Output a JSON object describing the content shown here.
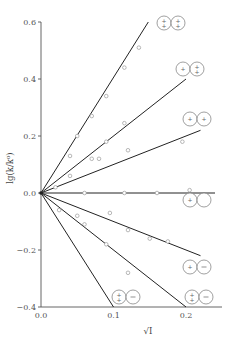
{
  "chart_data": {
    "type": "line",
    "title": "",
    "xlabel": "√I",
    "ylabel": "lg(k/k⁰)",
    "xlim": [
      0.0,
      0.25
    ],
    "ylim": [
      -0.4,
      0.6
    ],
    "x_ticks": [
      "0.0",
      "0.1",
      "0.2"
    ],
    "y_ticks": [
      "0.6",
      "0.4",
      "0.2",
      "0.0",
      "−0.2",
      "−0.4"
    ],
    "grid": false,
    "legend_position": "inline glyph labels at line ends",
    "series": [
      {
        "name": "(++)(++)",
        "zAzB": 4,
        "ion_a": "++",
        "ion_b": "++",
        "line": [
          [
            0.0,
            0.0
          ],
          [
            0.148,
            0.6
          ]
        ],
        "points": [
          [
            0.05,
            0.2
          ],
          [
            0.07,
            0.27
          ],
          [
            0.09,
            0.34
          ],
          [
            0.115,
            0.44
          ],
          [
            0.135,
            0.51
          ]
        ]
      },
      {
        "name": "(+)(++)",
        "zAzB": 2,
        "ion_a": "+",
        "ion_b": "++",
        "line": [
          [
            0.0,
            0.0
          ],
          [
            0.2,
            0.4
          ]
        ],
        "points": [
          [
            0.04,
            0.13
          ],
          [
            0.07,
            0.12
          ],
          [
            0.09,
            0.18
          ],
          [
            0.115,
            0.245
          ]
        ]
      },
      {
        "name": "(+)(+)",
        "zAzB": 1,
        "ion_a": "+",
        "ion_b": "+",
        "line": [
          [
            0.0,
            0.0
          ],
          [
            0.22,
            0.22
          ]
        ],
        "points": [
          [
            0.02,
            0.02
          ],
          [
            0.04,
            0.06
          ],
          [
            0.08,
            0.12
          ],
          [
            0.12,
            0.15
          ],
          [
            0.195,
            0.18
          ]
        ]
      },
      {
        "name": "(+)(○)",
        "zAzB": 0,
        "ion_a": "+",
        "ion_b": "0",
        "line": [
          [
            0.0,
            0.0
          ],
          [
            0.24,
            0.0
          ]
        ],
        "points": [
          [
            0.06,
            0.0
          ],
          [
            0.115,
            0.0
          ],
          [
            0.16,
            0.0
          ],
          [
            0.205,
            0.01
          ]
        ]
      },
      {
        "name": "(+)(−)",
        "zAzB": -1,
        "ion_a": "+",
        "ion_b": "−",
        "line": [
          [
            0.0,
            0.0
          ],
          [
            0.22,
            -0.22
          ]
        ],
        "points": [
          [
            0.095,
            -0.07
          ],
          [
            0.12,
            -0.13
          ],
          [
            0.15,
            -0.16
          ],
          [
            0.175,
            -0.17
          ]
        ]
      },
      {
        "name": "(++)(−)",
        "zAzB": -2,
        "ion_a": "++",
        "ion_b": "−",
        "line": [
          [
            0.0,
            0.0
          ],
          [
            0.2,
            -0.4
          ]
        ],
        "points": [
          [
            0.025,
            -0.06
          ],
          [
            0.05,
            -0.08
          ],
          [
            0.06,
            -0.11
          ],
          [
            0.09,
            -0.18
          ],
          [
            0.12,
            -0.28
          ]
        ]
      },
      {
        "name": "(++)(=)",
        "zAzB": -4,
        "ion_a": "++",
        "ion_b": "−",
        "line": [
          [
            0.0,
            0.0
          ],
          [
            0.1,
            -0.4
          ]
        ],
        "points": []
      }
    ]
  },
  "axes": {
    "x_title": "√I",
    "y_title": "lg(k/k⁰)"
  }
}
